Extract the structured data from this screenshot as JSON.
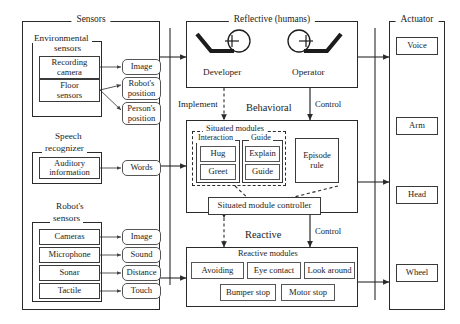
{
  "figure": {
    "type": "architecture-block-diagram",
    "columns": [
      "Sensors",
      "Reflective (humans)",
      "Behavioral",
      "Reactive",
      "Actuator"
    ]
  },
  "sensors": {
    "title": "Sensors",
    "groups": [
      {
        "title": "Environmental sensors",
        "title_line1": "Environmental",
        "title_line2": "sensors",
        "inputs": [
          {
            "label": "Recording camera",
            "line1": "Recording",
            "line2": "camera"
          },
          {
            "label": "Floor sensors",
            "line1": "Floor",
            "line2": "sensors"
          }
        ],
        "outputs": [
          {
            "label": "Image",
            "line1": "Image",
            "line2": ""
          },
          {
            "label": "Robot's position",
            "line1": "Robot's",
            "line2": "position"
          },
          {
            "label": "Person's position",
            "line1": "Person's",
            "line2": "position"
          }
        ]
      },
      {
        "title": "Speech recognizer",
        "title_line1": "Speech",
        "title_line2": "recognizer",
        "inputs": [
          {
            "label": "Auditory information",
            "line1": "Auditory",
            "line2": "information"
          }
        ],
        "outputs": [
          {
            "label": "Words",
            "line1": "Words",
            "line2": ""
          }
        ]
      },
      {
        "title": "Robot's sensors",
        "title_line1": "Robot's",
        "title_line2": "sensors",
        "inputs": [
          {
            "label": "Cameras",
            "line1": "Cameras",
            "line2": ""
          },
          {
            "label": "Microphone",
            "line1": "Microphone",
            "line2": ""
          },
          {
            "label": "Sonar",
            "line1": "Sonar",
            "line2": ""
          },
          {
            "label": "Tactile",
            "line1": "Tactile",
            "line2": ""
          }
        ],
        "outputs": [
          {
            "label": "Image",
            "line1": "Image",
            "line2": ""
          },
          {
            "label": "Sound",
            "line1": "Sound",
            "line2": ""
          },
          {
            "label": "Distance",
            "line1": "Distance",
            "line2": ""
          },
          {
            "label": "Touch",
            "line1": "Touch",
            "line2": ""
          }
        ]
      }
    ]
  },
  "reflective": {
    "title": "Reflective (humans)",
    "actors": [
      {
        "name": "Developer",
        "icon": "person-seated-icon"
      },
      {
        "name": "Operator",
        "icon": "person-seated-icon"
      }
    ]
  },
  "behavioral": {
    "title": "Behavioral",
    "situated_modules": {
      "title": "Situated modules",
      "subgroups": [
        {
          "title": "Interaction",
          "modules": [
            "Hug",
            "Greet"
          ]
        },
        {
          "title": "Guide",
          "modules": [
            "Explain",
            "Guide"
          ]
        }
      ],
      "episode_rule": {
        "label": "Episode rule",
        "line1": "Episode",
        "line2": "rule"
      }
    },
    "controller": {
      "label": "Situated module controller"
    }
  },
  "reactive": {
    "title": "Reactive",
    "modules_group_title": "Reactive modules",
    "row1": [
      "Avoiding",
      "Eye contact",
      "Look around"
    ],
    "row2": [
      "Bumper stop",
      "Motor stop"
    ]
  },
  "actuator": {
    "title": "Actuator",
    "items": [
      "Voice",
      "Arm",
      "Head",
      "Wheel"
    ]
  },
  "edge_labels": {
    "implement": "Implement",
    "control_behavioral": "Control",
    "control_reactive": "Control"
  },
  "colors": {
    "ink": "#1c1c1c",
    "line": "#2a2a2a",
    "box_border": "#555555",
    "background": "#ffffff"
  }
}
